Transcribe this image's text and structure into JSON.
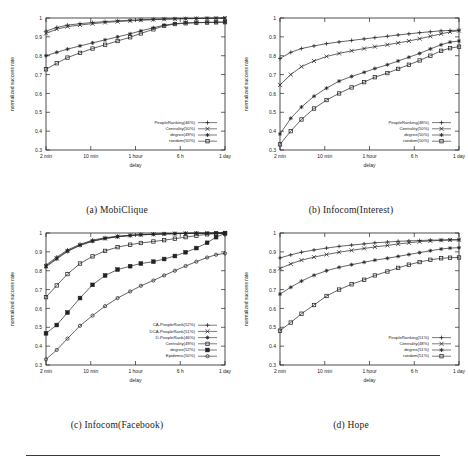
{
  "figure": {
    "panels": [
      {
        "id": "a",
        "caption": "(a)  MobiClique"
      },
      {
        "id": "b",
        "caption": "(b)  Infocom(Interest)"
      },
      {
        "id": "c",
        "caption": "(c)  Infocom(Facebook)"
      },
      {
        "id": "d",
        "caption": "(d)  Hope"
      }
    ],
    "rule_color": "#3a3a3a"
  },
  "axes_common": {
    "xlabel": "delay",
    "ylabel": "normalized success rate",
    "xticklabels": [
      "2 min",
      "10 min",
      "1 hour",
      "6 h",
      "1 day"
    ],
    "yticklabels": [
      "0.3",
      "0.4",
      "0.5",
      "0.6",
      "0.7",
      "0.8",
      "0.9",
      "1"
    ],
    "ylim": [
      0.3,
      1.0
    ],
    "grid": false
  },
  "chart_data": [
    {
      "type": "line",
      "panel": "a",
      "title": "(a)  MobiClique",
      "xlabel": "delay",
      "ylabel": "normalized success rate",
      "ylim": [
        0.3,
        1.0
      ],
      "xticklabels": [
        "2 min",
        "10 min",
        "1 hour",
        "6 h",
        "1 day"
      ],
      "x": [
        0,
        0.06,
        0.12,
        0.19,
        0.26,
        0.33,
        0.4,
        0.47,
        0.53,
        0.6,
        0.66,
        0.72,
        0.78,
        0.84,
        0.9,
        0.95,
        1.0
      ],
      "series": [
        {
          "name": "PeopleRanking(46%)",
          "marker": "plus",
          "values": [
            0.93,
            0.95,
            0.962,
            0.97,
            0.976,
            0.981,
            0.985,
            0.988,
            0.991,
            0.993,
            0.995,
            0.996,
            0.997,
            0.998,
            0.999,
            0.999,
            1.0
          ]
        },
        {
          "name": "Centrality(50%)",
          "marker": "cross",
          "values": [
            0.918,
            0.941,
            0.954,
            0.963,
            0.97,
            0.976,
            0.981,
            0.985,
            0.988,
            0.991,
            0.993,
            0.995,
            0.996,
            0.997,
            0.998,
            0.999,
            1.0
          ]
        },
        {
          "name": "degree(49%)",
          "marker": "star",
          "values": [
            0.8,
            0.818,
            0.835,
            0.852,
            0.868,
            0.884,
            0.9,
            0.916,
            0.932,
            0.948,
            0.962,
            0.97,
            0.974,
            0.976,
            0.977,
            0.978,
            0.978
          ]
        },
        {
          "name": "random(50%)",
          "marker": "square",
          "values": [
            0.728,
            0.76,
            0.79,
            0.815,
            0.838,
            0.858,
            0.878,
            0.898,
            0.918,
            0.94,
            0.958,
            0.968,
            0.972,
            0.975,
            0.976,
            0.977,
            0.978
          ]
        }
      ],
      "legend_position": "lower right"
    },
    {
      "type": "line",
      "panel": "b",
      "title": "(b)  Infocom(Interest)",
      "xlabel": "delay",
      "ylabel": "normalized success rate",
      "ylim": [
        0.3,
        1.0
      ],
      "xticklabels": [
        "2 min",
        "10 min",
        "1 hour",
        "6 h",
        "1 day"
      ],
      "x": [
        0,
        0.06,
        0.12,
        0.19,
        0.26,
        0.33,
        0.4,
        0.47,
        0.53,
        0.6,
        0.66,
        0.72,
        0.78,
        0.84,
        0.9,
        0.95,
        1.0
      ],
      "series": [
        {
          "name": "PeopleRanking(48%)",
          "marker": "plus",
          "values": [
            0.785,
            0.818,
            0.838,
            0.852,
            0.864,
            0.873,
            0.881,
            0.889,
            0.896,
            0.903,
            0.91,
            0.916,
            0.922,
            0.927,
            0.932,
            0.934,
            0.935
          ]
        },
        {
          "name": "Centrality(50%)",
          "marker": "cross",
          "values": [
            0.645,
            0.7,
            0.742,
            0.772,
            0.796,
            0.812,
            0.826,
            0.838,
            0.848,
            0.858,
            0.868,
            0.878,
            0.89,
            0.903,
            0.916,
            0.926,
            0.933
          ]
        },
        {
          "name": "degree(50%)",
          "marker": "star",
          "values": [
            0.385,
            0.468,
            0.528,
            0.585,
            0.628,
            0.665,
            0.69,
            0.712,
            0.732,
            0.752,
            0.772,
            0.792,
            0.812,
            0.836,
            0.858,
            0.872,
            0.878
          ]
        },
        {
          "name": "random(50%)",
          "marker": "square",
          "values": [
            0.33,
            0.4,
            0.462,
            0.52,
            0.565,
            0.6,
            0.632,
            0.66,
            0.686,
            0.708,
            0.73,
            0.752,
            0.775,
            0.8,
            0.826,
            0.84,
            0.848
          ]
        }
      ],
      "legend_position": "lower right"
    },
    {
      "type": "line",
      "panel": "c",
      "title": "(c)  Infocom(Facebook)",
      "xlabel": "delay",
      "ylabel": "normalized success rate",
      "ylim": [
        0.3,
        1.0
      ],
      "xticklabels": [
        "2 min",
        "10 min",
        "1 hour",
        "6 h",
        "1 day"
      ],
      "x": [
        0,
        0.06,
        0.12,
        0.19,
        0.26,
        0.33,
        0.4,
        0.47,
        0.53,
        0.6,
        0.66,
        0.72,
        0.78,
        0.84,
        0.9,
        0.95,
        1.0
      ],
      "series": [
        {
          "name": "CA-PeopleRank(52%)",
          "marker": "plus",
          "values": [
            0.83,
            0.872,
            0.91,
            0.94,
            0.962,
            0.975,
            0.983,
            0.988,
            0.992,
            0.994,
            0.996,
            0.997,
            0.998,
            0.999,
            0.999,
            1.0,
            1.0
          ]
        },
        {
          "name": "DCA-PeopleRank(51%)",
          "marker": "cross",
          "values": [
            0.825,
            0.866,
            0.905,
            0.936,
            0.958,
            0.972,
            0.981,
            0.987,
            0.991,
            0.993,
            0.995,
            0.997,
            0.998,
            0.999,
            0.999,
            1.0,
            1.0
          ]
        },
        {
          "name": "D-PeopleRank(46%)",
          "marker": "star",
          "values": [
            0.82,
            0.862,
            0.902,
            0.934,
            0.956,
            0.97,
            0.98,
            0.986,
            0.99,
            0.993,
            0.995,
            0.996,
            0.998,
            0.999,
            0.999,
            1.0,
            1.0
          ]
        },
        {
          "name": "Centrality(49%)",
          "marker": "opensquare",
          "values": [
            0.66,
            0.722,
            0.782,
            0.838,
            0.876,
            0.905,
            0.925,
            0.938,
            0.947,
            0.955,
            0.962,
            0.97,
            0.978,
            0.986,
            0.993,
            0.997,
            1.0
          ]
        },
        {
          "name": "degree(52%)",
          "marker": "filledsquare",
          "values": [
            0.468,
            0.512,
            0.578,
            0.655,
            0.725,
            0.775,
            0.806,
            0.824,
            0.838,
            0.848,
            0.862,
            0.878,
            0.898,
            0.92,
            0.948,
            0.978,
            0.998
          ]
        },
        {
          "name": "Epidemic(50%)",
          "marker": "circle",
          "values": [
            0.33,
            0.38,
            0.44,
            0.508,
            0.562,
            0.612,
            0.655,
            0.69,
            0.72,
            0.748,
            0.775,
            0.8,
            0.825,
            0.848,
            0.87,
            0.885,
            0.892
          ]
        }
      ],
      "legend_position": "lower right"
    },
    {
      "type": "line",
      "panel": "d",
      "title": "(d)  Hope",
      "xlabel": "delay",
      "ylabel": "normalized success rate",
      "ylim": [
        0.3,
        1.0
      ],
      "xticklabels": [
        "2 min",
        "10 min",
        "1 hour",
        "6 h",
        "1 day"
      ],
      "x": [
        0,
        0.06,
        0.12,
        0.19,
        0.26,
        0.33,
        0.4,
        0.47,
        0.53,
        0.6,
        0.66,
        0.72,
        0.78,
        0.84,
        0.9,
        0.95,
        1.0
      ],
      "series": [
        {
          "name": "PeopleRanking(51%)",
          "marker": "plus",
          "values": [
            0.868,
            0.884,
            0.898,
            0.91,
            0.92,
            0.929,
            0.936,
            0.942,
            0.948,
            0.952,
            0.956,
            0.958,
            0.96,
            0.962,
            0.963,
            0.964,
            0.964
          ]
        },
        {
          "name": "Centrality(48%)",
          "marker": "cross",
          "values": [
            0.812,
            0.836,
            0.856,
            0.872,
            0.886,
            0.898,
            0.908,
            0.918,
            0.926,
            0.934,
            0.942,
            0.948,
            0.954,
            0.958,
            0.961,
            0.963,
            0.964
          ]
        },
        {
          "name": "degree(51%)",
          "marker": "star",
          "values": [
            0.676,
            0.712,
            0.745,
            0.776,
            0.8,
            0.818,
            0.832,
            0.845,
            0.856,
            0.866,
            0.876,
            0.886,
            0.896,
            0.906,
            0.915,
            0.92,
            0.922
          ]
        },
        {
          "name": "random(51%)",
          "marker": "square",
          "values": [
            0.482,
            0.525,
            0.572,
            0.618,
            0.666,
            0.7,
            0.728,
            0.752,
            0.775,
            0.796,
            0.815,
            0.832,
            0.846,
            0.858,
            0.866,
            0.869,
            0.87
          ]
        }
      ],
      "legend_position": "lower right"
    }
  ]
}
